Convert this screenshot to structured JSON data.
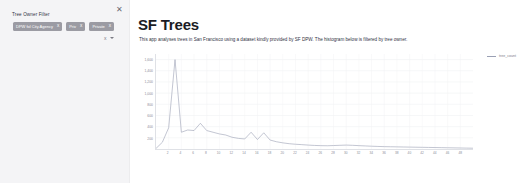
{
  "sidebar": {
    "close_icon": "close-icon",
    "filter_label": "Tree Owner Filter",
    "chips": [
      {
        "label": "DPW fol City Agency",
        "remove_icon": "x"
      },
      {
        "label": "Priv",
        "remove_icon": "x"
      },
      {
        "label": "Private",
        "remove_icon": "x"
      }
    ],
    "clear_icon": "x",
    "dropdown_icon": "chevron-down-icon"
  },
  "main": {
    "title": "SF Trees",
    "description": "This app analyses trees in San Francisco using a dataset kindly provided by SF DPW. The histogram below is filtered by tree owner."
  },
  "chart_data": {
    "type": "line",
    "title": "",
    "xlabel": "",
    "ylabel": "",
    "legend": [
      "tree_count"
    ],
    "legend_position": "top-right",
    "grid": true,
    "ylim": [
      0,
      1700
    ],
    "xlim": [
      0,
      50
    ],
    "yticks": [
      200,
      400,
      600,
      800,
      1000,
      1200,
      1400,
      1600
    ],
    "ytick_labels": [
      "200",
      "400",
      "600",
      "800",
      "1,000",
      "1,200",
      "1,400",
      "1,600"
    ],
    "xticks": [
      2,
      4,
      6,
      8,
      10,
      12,
      14,
      16,
      18,
      20,
      22,
      24,
      26,
      28,
      30,
      32,
      34,
      36,
      38,
      40,
      42,
      44,
      46,
      48
    ],
    "xtick_labels": [
      "2",
      "4",
      "6",
      "8",
      "10",
      "12",
      "14",
      "16",
      "18",
      "20",
      "22",
      "24",
      "26",
      "28",
      "30",
      "32",
      "34",
      "36",
      "38",
      "40",
      "42",
      "44",
      "46",
      "48"
    ],
    "series": [
      {
        "name": "tree_count",
        "color": "#9aa0b4",
        "x": [
          0,
          1,
          2,
          3,
          4,
          5,
          6,
          7,
          8,
          9,
          10,
          11,
          12,
          13,
          14,
          15,
          16,
          17,
          18,
          19,
          20,
          21,
          22,
          23,
          24,
          25,
          26,
          27,
          28,
          29,
          30,
          31,
          32,
          33,
          34,
          35,
          36,
          37,
          38,
          39,
          40,
          41,
          42,
          43,
          44,
          45,
          46,
          47,
          48,
          49,
          50
        ],
        "values": [
          10,
          120,
          380,
          1600,
          300,
          340,
          330,
          460,
          330,
          300,
          270,
          250,
          210,
          190,
          180,
          300,
          170,
          290,
          160,
          130,
          110,
          95,
          85,
          78,
          70,
          64,
          60,
          58,
          62,
          66,
          70,
          66,
          60,
          55,
          50,
          46,
          42,
          40,
          38,
          36,
          34,
          32,
          30,
          28,
          26,
          24,
          22,
          20,
          18,
          16,
          14
        ]
      }
    ]
  }
}
